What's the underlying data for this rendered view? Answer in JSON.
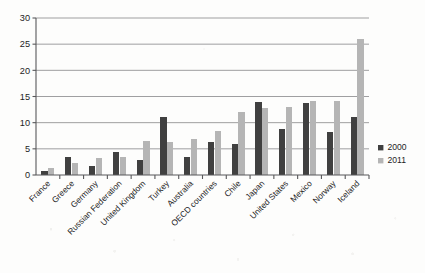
{
  "chart_data": {
    "type": "bar",
    "title": "",
    "subtitle": "",
    "xlabel": "",
    "ylabel": "",
    "ylim": [
      0,
      30
    ],
    "ytick_values": [
      0,
      5,
      10,
      15,
      20,
      25,
      30
    ],
    "ytick_labels": [
      "0",
      "5",
      "10",
      "15",
      "20",
      "25",
      "30"
    ],
    "grid": true,
    "grid_axis": "y",
    "legend_position": "right",
    "categories": [
      "France",
      "Greece",
      "Germany",
      "Russian Federation",
      "United Kingdom",
      "Turkey",
      "Australia",
      "OECD countries",
      "Chile",
      "Japan",
      "United States",
      "Mexico",
      "Norway",
      "Iceland"
    ],
    "series": [
      {
        "name": "2000",
        "color": "#404040",
        "values": [
          0.8,
          3.4,
          1.8,
          4.4,
          2.8,
          11.1,
          3.4,
          6.3,
          6.0,
          13.9,
          8.8,
          13.8,
          8.2,
          11.0
        ]
      },
      {
        "name": "2011",
        "color": "#b5b5b5",
        "values": [
          1.4,
          2.3,
          3.2,
          3.4,
          6.5,
          6.3,
          6.8,
          8.4,
          12.0,
          12.8,
          13.0,
          14.1,
          14.2,
          26.0
        ]
      }
    ]
  },
  "legend": {
    "items": [
      {
        "label": "2000",
        "color": "#404040"
      },
      {
        "label": "2011",
        "color": "#b5b5b5"
      }
    ]
  }
}
